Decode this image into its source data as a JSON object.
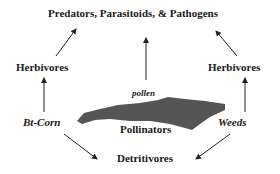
{
  "diagram": {
    "nodes": {
      "top": "Predators, Parasitoids, & Pathogens",
      "herbivores_left": "Herbivores",
      "herbivores_right": "Herbivores",
      "bt_corn": "Bt-Corn",
      "weeds": "Weeds",
      "pollinators": "Pollinators",
      "detritivores": "Detritivores",
      "pollen": "pollen"
    },
    "edges": [
      {
        "from": "Herbivores (left)",
        "to": "Predators, Parasitoids, & Pathogens"
      },
      {
        "from": "Pollinators",
        "to": "Predators, Parasitoids, & Pathogens"
      },
      {
        "from": "Herbivores (right)",
        "to": "Predators, Parasitoids, & Pathogens"
      },
      {
        "from": "Bt-Corn",
        "to": "Herbivores (left)"
      },
      {
        "from": "Weeds",
        "to": "Herbivores (right)"
      },
      {
        "from": "Bt-Corn",
        "to": "Detritivores"
      },
      {
        "from": "Weeds",
        "to": "Detritivores"
      }
    ],
    "colors": {
      "text": "#1a1a1a",
      "shape": "#555555",
      "arrow": "#222222"
    }
  }
}
